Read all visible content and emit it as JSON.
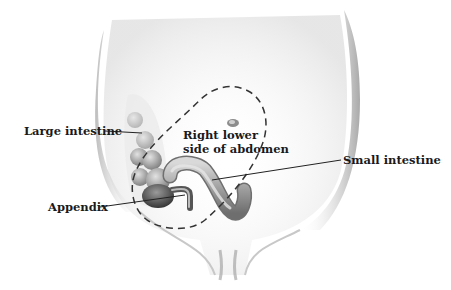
{
  "diagram": {
    "labels": {
      "large_intestine": "Large intestine",
      "region_line1": "Right lower",
      "region_line2": "side of abdomen",
      "small_intestine": "Small intestine",
      "appendix": "Appendix"
    },
    "colors": {
      "label_text": "#1a1a1a",
      "leader_line": "#222222",
      "dashed_outline": "#333333",
      "torso_shade": "#cfcfcf",
      "intestine_fill": "#a8a8a8",
      "intestine_dark": "#555555"
    }
  }
}
